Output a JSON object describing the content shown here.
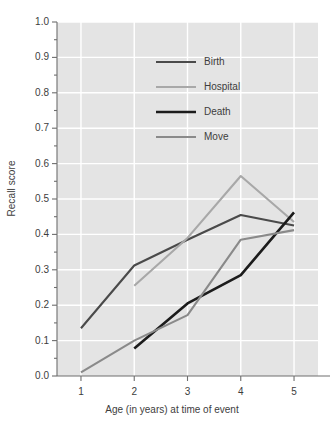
{
  "chart_data": {
    "type": "line",
    "title": "",
    "xlabel": "Age (in years) at time of event",
    "ylabel": "Recall score",
    "x": [
      1,
      2,
      3,
      4,
      5
    ],
    "xlim": [
      0.55,
      5.45
    ],
    "ylim": [
      0.0,
      1.0
    ],
    "xticks": [
      "1",
      "2",
      "3",
      "4",
      "5"
    ],
    "yticks": [
      "0.0",
      "0.1",
      "0.2",
      "0.3",
      "0.4",
      "0.5",
      "0.6",
      "0.7",
      "0.8",
      "0.9",
      "1.0"
    ],
    "ytick_values": [
      0.0,
      0.1,
      0.2,
      0.3,
      0.4,
      0.5,
      0.6,
      0.7,
      0.8,
      0.9,
      1.0
    ],
    "minor_ytick_values": [
      0.05,
      0.15,
      0.25,
      0.35,
      0.45,
      0.55,
      0.65,
      0.75,
      0.85,
      0.95
    ],
    "grid": true,
    "grid_color": "#ffffff",
    "plot_background": "#e4e4e4",
    "legend_position": "upper-center",
    "series": [
      {
        "name": "Birth",
        "color": "#4a4a4a",
        "width": 2.1,
        "x": [
          1,
          2,
          3,
          4,
          5
        ],
        "values": [
          0.135,
          0.312,
          0.385,
          0.455,
          0.425
        ]
      },
      {
        "name": "Hospital",
        "color": "#a8a8a8",
        "width": 2.1,
        "x": [
          2,
          3,
          4,
          5
        ],
        "values": [
          0.255,
          0.39,
          0.565,
          0.435
        ]
      },
      {
        "name": "Death",
        "color": "#1c1c1c",
        "width": 2.6,
        "x": [
          2,
          3,
          4,
          5
        ],
        "values": [
          0.078,
          0.205,
          0.285,
          0.462
        ]
      },
      {
        "name": "Move",
        "color": "#8a8a8a",
        "width": 2.1,
        "x": [
          1,
          2,
          3,
          4,
          5
        ],
        "values": [
          0.01,
          0.1,
          0.172,
          0.385,
          0.412
        ]
      }
    ]
  },
  "legend": {
    "items": [
      {
        "label": "Birth",
        "color": "#4a4a4a",
        "width": 2.1
      },
      {
        "label": "Hospital",
        "color": "#a8a8a8",
        "width": 2.1
      },
      {
        "label": "Death",
        "color": "#1c1c1c",
        "width": 2.6
      },
      {
        "label": "Move",
        "color": "#8a8a8a",
        "width": 2.1
      }
    ]
  },
  "axes": {
    "spine_color": "#6e6e6e"
  }
}
